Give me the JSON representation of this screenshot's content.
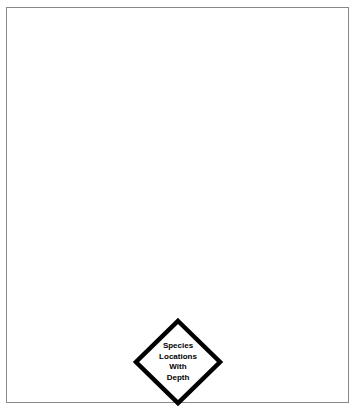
{
  "document": {
    "background_color": "#ffffff",
    "frame": {
      "border_color": "#888888",
      "border_width_px": 1,
      "fill_color": "#ffffff"
    }
  },
  "diagram": {
    "type": "flowchart",
    "nodes": [
      {
        "id": "species-locations-with-depth",
        "shape": "diamond",
        "role": "decision",
        "fill_color": "#ffffff",
        "stroke_color": "#000000",
        "stroke_width_px": 4,
        "text_color": "#000000",
        "bold": true,
        "center": {
          "x": 176,
          "y": 360
        },
        "width_px": 88,
        "height_px": 86,
        "label_lines": [
          "Species",
          "Locations",
          "With",
          "Depth"
        ],
        "label_text": "Species Locations With Depth"
      }
    ],
    "edges": []
  }
}
